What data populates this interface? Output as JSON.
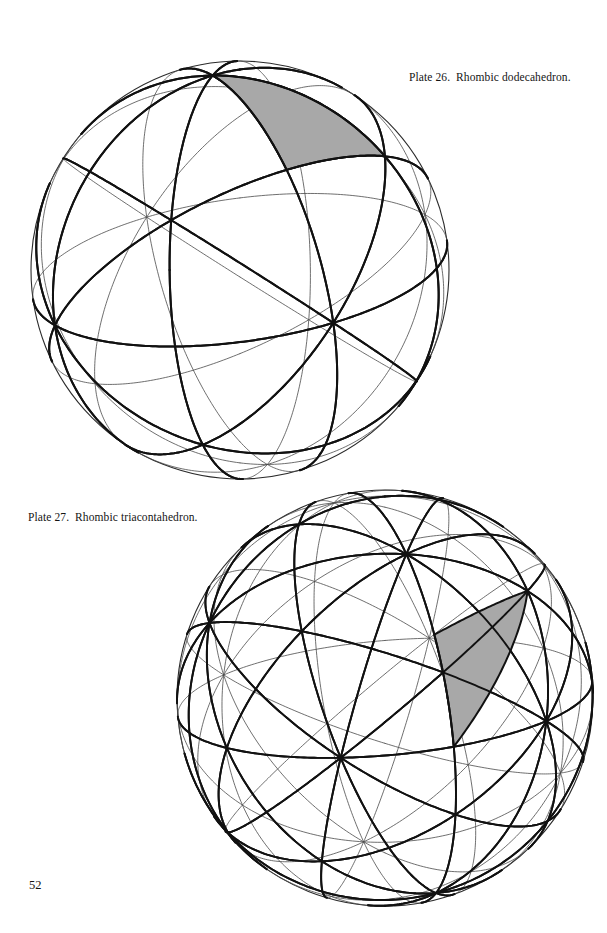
{
  "page": {
    "number": "52",
    "width": 607,
    "height": 933,
    "background": "#ffffff",
    "ink": "#141414"
  },
  "figures": [
    {
      "id": "plate-26",
      "caption": "Plate 26.  Rhombic dodecahedron.",
      "caption_plate": "Plate 26.",
      "caption_subject": "Rhombic dodecahedron.",
      "caption_x": 409,
      "caption_y": 70,
      "caption_align": "right",
      "sphere": {
        "cx": 240,
        "cy": 270,
        "r": 209,
        "outline_color": "#2b2b2b",
        "outline_width": 1.1,
        "symmetry": "octahedral",
        "great_circle_count": 9,
        "heavy_color": "#111111",
        "heavy_width": 2.0,
        "light_color": "#4a4a4a",
        "light_width": 0.8
      },
      "shaded_triangle": {
        "fill": "#a8a8a8",
        "stroke": "#111111",
        "stroke_width": 2.0,
        "description": "characteristic spherical triangle"
      },
      "view": {
        "yaw_deg": 24,
        "pitch_deg": 20,
        "roll_deg": 8
      }
    },
    {
      "id": "plate-27",
      "caption": "Plate 27.  Rhombic triacontahedron.",
      "caption_plate": "Plate 27.",
      "caption_subject": "Rhombic triacontahedron.",
      "caption_x": 28,
      "caption_y": 510,
      "caption_align": "left",
      "sphere": {
        "cx": 385,
        "cy": 698,
        "r": 208,
        "outline_color": "#2b2b2b",
        "outline_width": 1.1,
        "symmetry": "icosahedral",
        "great_circle_count": 15,
        "heavy_color": "#111111",
        "heavy_width": 1.9,
        "light_color": "#4a4a4a",
        "light_width": 0.8
      },
      "shaded_triangle": {
        "fill": "#a8a8a8",
        "stroke": "#111111",
        "stroke_width": 2.0,
        "description": "characteristic spherical triangle"
      },
      "view": {
        "yaw_deg": 18,
        "pitch_deg": 16,
        "roll_deg": 5
      }
    }
  ],
  "chart_data": {
    "type": "diagram",
    "panels": [
      {
        "label": "Plate 26.  Rhombic dodecahedron.",
        "kind": "great-circle sphere",
        "symmetry_group": "octahedral (m-3m)",
        "great_circles": 9,
        "shaded_regions": 1,
        "center_px": [
          240,
          270
        ],
        "radius_px": 209
      },
      {
        "label": "Plate 27.  Rhombic triacontahedron.",
        "kind": "great-circle sphere",
        "symmetry_group": "icosahedral (m-3-5)",
        "great_circles": 15,
        "shaded_regions": 1,
        "center_px": [
          385,
          698
        ],
        "radius_px": 208
      }
    ]
  }
}
